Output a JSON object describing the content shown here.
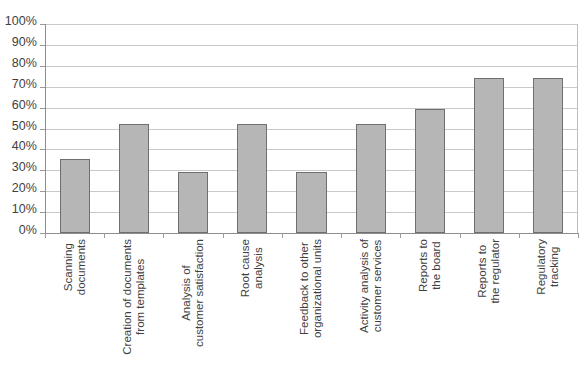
{
  "chart_data": {
    "type": "bar",
    "title": "",
    "subtitle": "",
    "xlabel": "",
    "ylabel": "",
    "ylim": [
      0,
      100
    ],
    "grid": true,
    "legend": false,
    "value_suffix": "%",
    "y_ticks": [
      "0%",
      "10%",
      "20%",
      "30%",
      "40%",
      "50%",
      "60%",
      "70%",
      "80%",
      "90%",
      "100%"
    ],
    "y_tick_values": [
      0,
      10,
      20,
      30,
      40,
      50,
      60,
      70,
      80,
      90,
      100
    ],
    "categories": [
      "Scanning documents",
      "Creation of documents from templates",
      "Analysis of customer satisfaction",
      "Root cause analysis",
      "Feedback to other organizational units",
      "Activity analysis of customer services",
      "Reports to the board",
      "Reports to the regulator",
      "Regulatory tracking"
    ],
    "category_lines": [
      [
        "Scanning",
        "documents"
      ],
      [
        "Creation of documents",
        "from templates"
      ],
      [
        "Analysis of",
        "customer satisfaction"
      ],
      [
        "Root cause",
        "analysis"
      ],
      [
        "Feedback to other",
        "organizational units"
      ],
      [
        "Activity analysis of",
        "customer services"
      ],
      [
        "Reports to",
        "the board"
      ],
      [
        "Reports to",
        "the regulator"
      ],
      [
        "Regulatory",
        "tracking"
      ]
    ],
    "values": [
      35.5,
      52,
      29,
      52,
      29,
      52,
      59.5,
      74,
      74
    ],
    "colors": {
      "bar_fill": "#b6b6b6",
      "bar_border": "#6f6f6f",
      "gridline": "#c9c9c9",
      "axis": "#8d8d8d",
      "text": "#3f3f3f",
      "background": "#ffffff"
    }
  }
}
